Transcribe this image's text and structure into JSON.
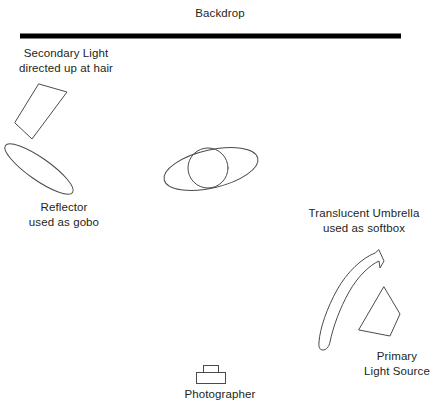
{
  "diagram": {
    "line_color": "#4b4b4b",
    "backdrop_color": "#000000",
    "text_color": "#231f20",
    "labels": {
      "backdrop": {
        "line1": "Backdrop"
      },
      "secondary_light": {
        "line1": "Secondary Light",
        "line2": "directed up at hair"
      },
      "reflector": {
        "line1": "Reflector",
        "line2": "used as gobo"
      },
      "umbrella": {
        "line1": "Translucent Umbrella",
        "line2": "used as softbox"
      },
      "primary_light": {
        "line1": "Primary",
        "line2": "Light Source"
      },
      "photographer": {
        "line1": "Photographer"
      }
    },
    "elements": {
      "backdrop": {
        "name": "backdrop-bar",
        "x1": 20,
        "y1": 36,
        "x2": 401,
        "y2": 36,
        "thickness": 5
      },
      "secondary_light": {
        "name": "secondary-light-shape",
        "points": "39,84 67,92 32,139 15,123"
      },
      "reflector": {
        "name": "reflector-ellipse",
        "cx": 39,
        "cy": 169,
        "rx": 41,
        "ry": 11,
        "rotation": 35
      },
      "subject_body": {
        "name": "subject-body-ellipse",
        "cx": 211,
        "cy": 169,
        "rx": 48,
        "ry": 19,
        "rotation": -13
      },
      "subject_head": {
        "name": "subject-head-circle",
        "cx": 208,
        "cy": 168,
        "r": 20
      },
      "umbrella": {
        "name": "umbrella-arc-shape"
      },
      "primary_light": {
        "name": "primary-light-shape",
        "points": "384,287 400,314 390,336 359,330"
      },
      "camera_body": {
        "name": "camera-body",
        "x": 196,
        "y": 372,
        "w": 30,
        "h": 12
      },
      "camera_viewfinder": {
        "name": "camera-viewfinder",
        "x": 203,
        "y": 365,
        "w": 15,
        "h": 8
      }
    }
  }
}
